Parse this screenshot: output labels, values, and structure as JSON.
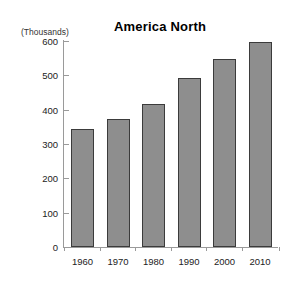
{
  "chart_data": {
    "type": "bar",
    "title": "America North",
    "units_caption": "(Thousands)",
    "xlabel": "",
    "ylabel": "",
    "categories": [
      "1960",
      "1970",
      "1980",
      "1990",
      "2000",
      "2010"
    ],
    "values": [
      344,
      374,
      418,
      492,
      547,
      597
    ],
    "series": [
      {
        "name": "America North",
        "values": [
          344,
          374,
          418,
          492,
          547,
          597
        ]
      }
    ],
    "ylim": [
      0,
      600
    ],
    "yticks": [
      0,
      100,
      200,
      300,
      400,
      500,
      600
    ],
    "ytick_labels": [
      "0",
      "100",
      "200",
      "300",
      "400",
      "500",
      "600"
    ],
    "grid": false,
    "legend": false,
    "legend_position": "none",
    "bar_color": "#8e8e8e",
    "bar_border_color": "#3b3b3b",
    "axis_color": "#9a9a9a",
    "background_color": "#ffffff",
    "text_color": "#222222"
  }
}
